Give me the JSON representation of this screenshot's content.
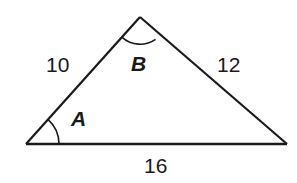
{
  "figure": {
    "kind": "triangle-diagram",
    "background_color": "#ffffff",
    "stroke_color": "#1a1a1a",
    "stroke_width": 2.2,
    "text_color": "#1a1a1a",
    "vertices": {
      "a": {
        "name": "A",
        "x": 26,
        "y": 144
      },
      "b": {
        "name": "B",
        "x": 140,
        "y": 17
      },
      "c": {
        "name": "C",
        "x": 287,
        "y": 144
      }
    },
    "sides": [
      {
        "id": "side-left",
        "semantic": "side-from-A-to-B",
        "length_label": "10",
        "from": "a",
        "to": "b"
      },
      {
        "id": "side-right",
        "semantic": "side-from-B-to-C",
        "length_label": "12",
        "from": "b",
        "to": "c"
      },
      {
        "id": "side-base",
        "semantic": "side-from-A-to-C",
        "length_label": "16",
        "from": "a",
        "to": "c"
      }
    ],
    "angles": [
      {
        "id": "angle-a",
        "label": "A",
        "at_vertex": "a",
        "arc_radius": 33
      },
      {
        "id": "angle-b",
        "label": "B",
        "at_vertex": "b",
        "arc_radius": 27
      }
    ],
    "paths": {
      "side_left": "M 26 144 L 140 17",
      "side_right": "M 140 17 L 287 144",
      "side_base": "M 26 144 L 287 144",
      "arc_a": "M 59 144 A 33 33 0 0 0 47.9 119.3",
      "arc_b": "M 122.1 37.4 A 27 27 0 0 0 155.5 39.3"
    }
  }
}
